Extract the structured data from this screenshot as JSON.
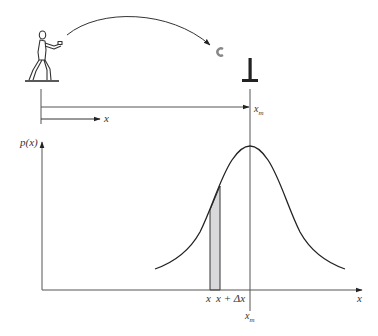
{
  "figure": {
    "type": "diagram"
  },
  "top_panel": {
    "thrower_icon": "person-throwing-icon",
    "projectile_icon": "horseshoe-icon",
    "target_icon": "target-stake-icon",
    "distance_label": "x",
    "target_label": "x",
    "target_label_sub": "m"
  },
  "bottom_panel": {
    "y_axis_label": "p(x)",
    "x_axis_label": "x",
    "strip_left_label": "x",
    "strip_right_label": "x + Δx",
    "peak_label": "x",
    "peak_label_sub": "m",
    "strip_fill": "#d9d9dc",
    "line_color": "#222222"
  }
}
